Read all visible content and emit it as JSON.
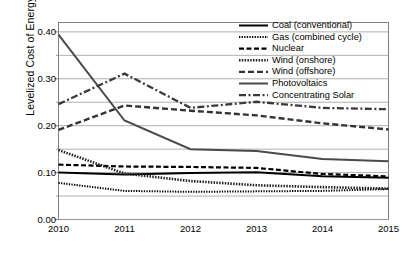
{
  "chart_data": {
    "type": "line",
    "title": "",
    "xlabel": "",
    "ylabel": "Levelized Cost of Energy ($/kWh)",
    "categories": [
      "2010",
      "2011",
      "2012",
      "2013",
      "2014",
      "2015"
    ],
    "x": [
      2010,
      2011,
      2012,
      2013,
      2014,
      2015
    ],
    "xlim": [
      2010,
      2015
    ],
    "ylim": [
      0.0,
      0.42
    ],
    "yticks": [
      "0.00",
      "0.10",
      "0.20",
      "0.30",
      "0.40"
    ],
    "ytick_values": [
      0.0,
      0.1,
      0.2,
      0.3,
      0.4
    ],
    "gridlines": [
      0.0,
      0.05,
      0.1,
      0.15,
      0.2,
      0.25,
      0.3,
      0.35,
      0.4
    ],
    "grid": "horizontal",
    "legend_position": "top-right",
    "series": [
      {
        "name": "Coal (conventional)",
        "style": "solid-thick",
        "color": "#000000",
        "values": [
          0.1,
          0.096,
          0.099,
          0.101,
          0.092,
          0.089
        ]
      },
      {
        "name": "Gas (combined cycle)",
        "style": "fine-dotted",
        "color": "#000000",
        "values": [
          0.078,
          0.061,
          0.059,
          0.06,
          0.061,
          0.065
        ]
      },
      {
        "name": "Nuclear",
        "style": "dashed",
        "color": "#000000",
        "values": [
          0.117,
          0.113,
          0.112,
          0.11,
          0.097,
          0.092
        ]
      },
      {
        "name": "Wind (onshore)",
        "style": "dotted-thick",
        "color": "#222222",
        "values": [
          0.148,
          0.098,
          0.082,
          0.073,
          0.069,
          0.066
        ]
      },
      {
        "name": "Wind (offshore)",
        "style": "dashed-thick",
        "color": "#333333",
        "values": [
          0.191,
          0.243,
          0.232,
          0.222,
          0.205,
          0.192
        ]
      },
      {
        "name": "Photovoltaics",
        "style": "solid-medium",
        "color": "#4a4a4a",
        "values": [
          0.394,
          0.211,
          0.15,
          0.146,
          0.129,
          0.124
        ]
      },
      {
        "name": "Concentrating Solar",
        "style": "dash-dot",
        "color": "#3a3a3a",
        "values": [
          0.246,
          0.311,
          0.238,
          0.251,
          0.238,
          0.235
        ]
      }
    ]
  },
  "caption": ""
}
